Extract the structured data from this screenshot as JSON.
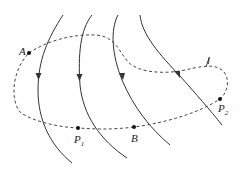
{
  "diagram": {
    "type": "field-lines-with-closed-path",
    "field_lines": {
      "count": 4,
      "arrow_direction": "down",
      "style": "solid"
    },
    "path": {
      "label": "l",
      "style": "dashed",
      "closed": true
    },
    "points": [
      {
        "name": "A",
        "label": "A",
        "sub": ""
      },
      {
        "name": "P1",
        "label": "P",
        "sub": "1"
      },
      {
        "name": "B",
        "label": "B",
        "sub": ""
      },
      {
        "name": "P2",
        "label": "P",
        "sub": "2"
      }
    ],
    "colors": {
      "line": "#333333",
      "background": "#ffffff"
    }
  }
}
